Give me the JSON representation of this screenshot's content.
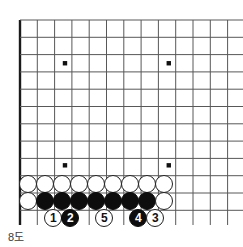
{
  "figure": {
    "kind": "go-board-diagram",
    "caption": "8도",
    "board": {
      "columns": 13,
      "rows": 12,
      "cell_size": 17.3,
      "origin_x": 20,
      "origin_y": 20,
      "line_color": "#585858",
      "edge_color": "#1a1a1a",
      "background": "#ffffff",
      "star_points": [
        {
          "col": 2.6,
          "row": 2.5
        },
        {
          "col": 8.6,
          "row": 2.5
        },
        {
          "col": 2.6,
          "row": 8.4
        },
        {
          "col": 8.6,
          "row": 8.4
        }
      ]
    },
    "stones": [
      {
        "id": "w-r1-c1",
        "color": "white",
        "label": "",
        "x": 28,
        "y": 184
      },
      {
        "id": "w-r1-c2",
        "color": "white",
        "label": "",
        "x": 45,
        "y": 184
      },
      {
        "id": "w-r1-c3",
        "color": "white",
        "label": "",
        "x": 62,
        "y": 184
      },
      {
        "id": "w-r1-c4",
        "color": "white",
        "label": "",
        "x": 79,
        "y": 184
      },
      {
        "id": "w-r1-c5",
        "color": "white",
        "label": "",
        "x": 96,
        "y": 184
      },
      {
        "id": "w-r1-c6",
        "color": "white",
        "label": "",
        "x": 113,
        "y": 184
      },
      {
        "id": "w-r1-c7",
        "color": "white",
        "label": "",
        "x": 130,
        "y": 184
      },
      {
        "id": "w-r1-c8",
        "color": "white",
        "label": "",
        "x": 147,
        "y": 184
      },
      {
        "id": "w-r1-c9",
        "color": "white",
        "label": "",
        "x": 164,
        "y": 184
      },
      {
        "id": "w-r2-c0",
        "color": "white",
        "label": "",
        "x": 28,
        "y": 201
      },
      {
        "id": "b-r2-c1",
        "color": "black",
        "label": "",
        "x": 45,
        "y": 201
      },
      {
        "id": "b-r2-c2",
        "color": "black",
        "label": "",
        "x": 62,
        "y": 201
      },
      {
        "id": "b-r2-c3",
        "color": "black",
        "label": "",
        "x": 79,
        "y": 201
      },
      {
        "id": "b-r2-c4",
        "color": "black",
        "label": "",
        "x": 96,
        "y": 201
      },
      {
        "id": "b-r2-c5",
        "color": "black",
        "label": "",
        "x": 113,
        "y": 201
      },
      {
        "id": "b-r2-c6",
        "color": "black",
        "label": "",
        "x": 130,
        "y": 201
      },
      {
        "id": "b-r2-c7",
        "color": "black",
        "label": "",
        "x": 147,
        "y": 201
      },
      {
        "id": "w-r2-c8",
        "color": "white",
        "label": "",
        "x": 164,
        "y": 201
      },
      {
        "id": "move-1",
        "color": "white",
        "label": "1",
        "x": 53,
        "y": 218
      },
      {
        "id": "move-2",
        "color": "black",
        "label": "2",
        "x": 70,
        "y": 218
      },
      {
        "id": "move-5",
        "color": "white",
        "label": "5",
        "x": 104,
        "y": 218
      },
      {
        "id": "move-4",
        "color": "black",
        "label": "4",
        "x": 138,
        "y": 218
      },
      {
        "id": "move-3",
        "color": "white",
        "label": "3",
        "x": 155,
        "y": 218
      }
    ]
  }
}
